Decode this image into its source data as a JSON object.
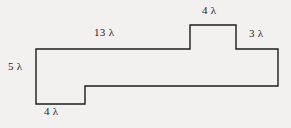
{
  "figure": {
    "background_color": "#f3f1ef",
    "stroke_color": "#1c1c1c",
    "stroke_width": 1.4,
    "fill_color": "#f3f1ef",
    "unit_symbol": "λ",
    "outline_points": "36,49 190,49 190,25 236,25 236,49 278,49 278,86 85,86 85,104 36,104",
    "vertices": [
      {
        "name": "top-left",
        "x": 36,
        "y": 49
      },
      {
        "name": "bump-left-base",
        "x": 190,
        "y": 49
      },
      {
        "name": "bump-top-left",
        "x": 190,
        "y": 25
      },
      {
        "name": "bump-top-right",
        "x": 236,
        "y": 25
      },
      {
        "name": "bump-right-base",
        "x": 236,
        "y": 49
      },
      {
        "name": "top-right",
        "x": 278,
        "y": 49
      },
      {
        "name": "bottom-right",
        "x": 278,
        "y": 86
      },
      {
        "name": "notch-right",
        "x": 85,
        "y": 86
      },
      {
        "name": "notch-bottom",
        "x": 85,
        "y": 104
      },
      {
        "name": "bottom-left",
        "x": 36,
        "y": 104
      }
    ]
  },
  "labels": {
    "left_height": {
      "value": "5",
      "unit": "λ",
      "text": "5 λ",
      "x": 8,
      "y": 60
    },
    "top_long": {
      "value": "13",
      "unit": "λ",
      "text": "13 λ",
      "x": 94,
      "y": 26
    },
    "bump_top": {
      "value": "4",
      "unit": "λ",
      "text": "4 λ",
      "x": 202,
      "y": 4
    },
    "right_height": {
      "value": "3",
      "unit": "λ",
      "text": "3 λ",
      "x": 249,
      "y": 27
    },
    "bottom_left": {
      "value": "4",
      "unit": "λ",
      "text": "4 λ",
      "x": 44,
      "y": 105
    }
  }
}
